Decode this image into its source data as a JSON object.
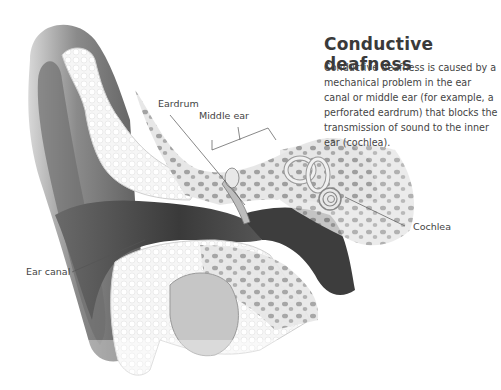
{
  "title": "Conductive deafness",
  "description": "Conductive deafness is caused by a mechanical problem in the ear canal or middle ear (for example, a perforated eardrum) that blocks the transmission of sound to the inner ear (cochlea).",
  "labels": {
    "eardrum": "Eardrum",
    "middle_ear": "Middle ear",
    "cochlea": "Cochlea",
    "ear_canal": "Ear canal"
  },
  "colors": {
    "text": "#444444",
    "title": "#3a3a3a",
    "bone": "#f3f3f3",
    "cavity": "#9a9a9a",
    "dark": "#3a3a3a",
    "leader_line": "#555555"
  }
}
